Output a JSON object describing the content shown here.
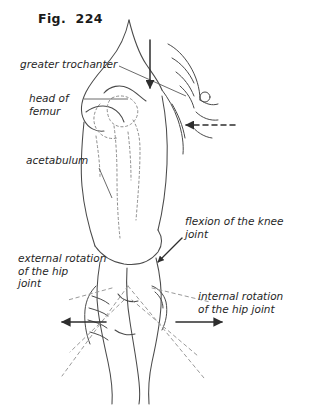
{
  "figure": {
    "title": "Fig.  224",
    "background_color": "#ffffff",
    "ink_color": "#3a3a3a",
    "text_color": "#262626"
  },
  "annotations": {
    "greater_trochanter": "greater trochanter",
    "head_of_femur": "head of\nfemur",
    "acetabulum": "acetabulum",
    "flexion_of_knee": "flexion of the knee\njoint",
    "external_rotation": "external rotation\nof the hip\njoint",
    "internal_rotation": "internal rotation\nof the hip joint"
  },
  "arrows": {
    "downward_force": "solid-arrow-down",
    "hand_pressure": "dashed-arrow-left",
    "knee_flexion": "solid-arrow-down-left",
    "external_rotation": "solid-arrow-left",
    "internal_rotation": "solid-arrow-right"
  },
  "illustration": {
    "subject": "hip-examination-leg-and-pelvis",
    "bone_outline_style": "dotted",
    "rotation_range_style": "dashed"
  }
}
